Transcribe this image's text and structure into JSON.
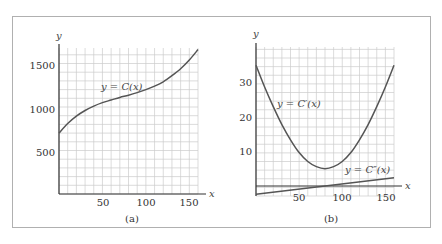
{
  "chart_data": [
    {
      "panel": "(a)",
      "type": "line",
      "title": "",
      "xlabel": "x",
      "ylabel": "y",
      "xlim": [
        0,
        160
      ],
      "ylim": [
        0,
        1750
      ],
      "xticks": [
        50,
        100,
        150
      ],
      "yticks": [
        500,
        1000,
        1500
      ],
      "grid": true,
      "series": [
        {
          "name": "y = C(x)",
          "x": [
            0,
            10,
            20,
            30,
            40,
            50,
            60,
            70,
            80,
            90,
            100,
            110,
            120,
            130,
            140,
            150,
            160
          ],
          "y": [
            700,
            810,
            895,
            960,
            1010,
            1050,
            1080,
            1110,
            1135,
            1165,
            1200,
            1240,
            1290,
            1360,
            1440,
            1540,
            1660
          ]
        }
      ],
      "caption": "(a)"
    },
    {
      "panel": "(b)",
      "type": "line",
      "title": "",
      "xlabel": "x",
      "ylabel": "y",
      "xlim": [
        0,
        160
      ],
      "ylim": [
        -3,
        38
      ],
      "xticks": [
        50,
        100,
        150
      ],
      "yticks": [
        10,
        20,
        30
      ],
      "grid": true,
      "series": [
        {
          "name": "y = C'(x)",
          "x": [
            0,
            10,
            20,
            30,
            40,
            50,
            60,
            70,
            80,
            90,
            100,
            110,
            120,
            130,
            140,
            150,
            160
          ],
          "y": [
            35,
            28.7,
            23,
            17.8,
            13.4,
            9.7,
            7.1,
            5.6,
            5,
            5.6,
            7.1,
            9.7,
            13.4,
            17.8,
            23,
            28.7,
            35
          ]
        },
        {
          "name": "y = C''(x)",
          "x": [
            0,
            160
          ],
          "y": [
            -2.4,
            2.4
          ]
        }
      ],
      "caption": "(b)"
    }
  ],
  "panel_a": {
    "y_axis_label": "y",
    "x_axis_label": "x",
    "y_ticks": [
      "500",
      "1000",
      "1500"
    ],
    "x_ticks": [
      "50",
      "100",
      "150"
    ],
    "curve_label": "y = C(x)",
    "caption": "(a)"
  },
  "panel_b": {
    "y_axis_label": "y",
    "x_axis_label": "x",
    "y_ticks": [
      "10",
      "20",
      "30"
    ],
    "x_ticks": [
      "50",
      "100",
      "150"
    ],
    "curve_label_1": "y = C′(x)",
    "curve_label_2": "y = C″(x)",
    "caption": "(b)"
  },
  "colors": {
    "curve": "#555555",
    "grid": "#cccccc",
    "axis": "#333333",
    "frame": "#b0b0b0"
  }
}
